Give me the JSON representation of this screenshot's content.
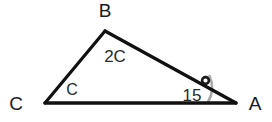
{
  "figure": {
    "type": "triangle-geometry-diagram",
    "background_color": "#ffffff",
    "stroke_color": "#111111",
    "arc_color": "#a8a8a8",
    "label_color": "#1a1a1a"
  },
  "vertices": {
    "B": {
      "label": "B",
      "x": 105,
      "y": 31,
      "label_x": 105,
      "label_y": 17
    },
    "C": {
      "label": "C",
      "x": 45,
      "y": 103,
      "label_x": 16,
      "label_y": 104
    },
    "A": {
      "label": "A",
      "x": 236,
      "y": 103,
      "label_x": 255,
      "label_y": 104
    }
  },
  "angles": {
    "at_B": {
      "label": "2C",
      "x": 112,
      "y": 56
    },
    "at_C": {
      "label": "C",
      "x": 71,
      "y": 90
    },
    "at_A": {
      "value": "15",
      "degree_symbol": "°",
      "x": 190,
      "y": 95,
      "arc_radius": 28
    }
  },
  "sides": [
    {
      "name": "CB",
      "from": "C",
      "to": "B"
    },
    {
      "name": "BA",
      "from": "B",
      "to": "A"
    },
    {
      "name": "CA",
      "from": "C",
      "to": "A"
    }
  ]
}
